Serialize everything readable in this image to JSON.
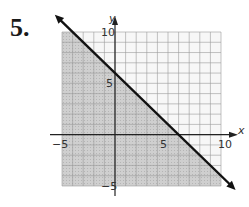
{
  "problem": {
    "number": "5."
  },
  "chart_data": {
    "type": "line",
    "title": "",
    "xlabel": "x",
    "ylabel": "y",
    "xlim": [
      -5,
      10
    ],
    "ylim": [
      -5,
      10
    ],
    "grid": true,
    "grid_step": 1,
    "x_tick_labels": [
      {
        "value": -5,
        "label": "−5"
      },
      {
        "value": 5,
        "label": "5"
      },
      {
        "value": 10,
        "label": "10"
      }
    ],
    "y_tick_labels": [
      {
        "value": 10,
        "label": "10"
      },
      {
        "value": 5,
        "label": "5"
      },
      {
        "value": -5,
        "label": "−5"
      }
    ],
    "boundary_line": {
      "equation": "y = -x + 6",
      "slope": -1,
      "y_intercept": 6,
      "x_intercept": 6,
      "style": "solid",
      "arrows": "both"
    },
    "inequality": "y ≤ -x + 6",
    "shaded_region": "below line",
    "colors": {
      "shade": "#c8c8c8",
      "grid": "#9a9a9a",
      "axis": "#222222",
      "line": "#111111"
    }
  }
}
